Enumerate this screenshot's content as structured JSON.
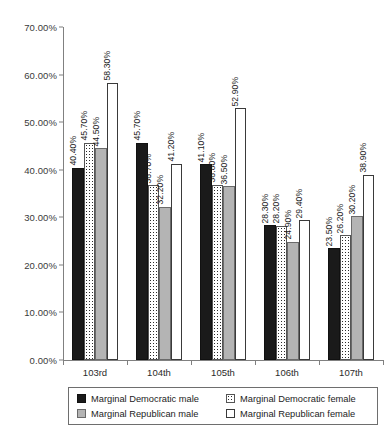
{
  "chart_data": {
    "type": "bar",
    "title": "",
    "subtitle": "",
    "xlabel": "",
    "ylabel": "",
    "categories": [
      "103rd",
      "104th",
      "105th",
      "106th",
      "107th"
    ],
    "series": [
      {
        "name": "Marginal Democratic male",
        "color": "#1a1a1a",
        "pattern": "solid-black",
        "values": [
          40.4,
          45.7,
          41.1,
          28.3,
          23.5
        ],
        "labels": [
          "40.40%",
          "45.70%",
          "41.10%",
          "28.30%",
          "23.50%"
        ]
      },
      {
        "name": "Marginal Democratic female",
        "color": "#ffffff",
        "pattern": "dotted",
        "values": [
          45.7,
          36.7,
          36.8,
          28.2,
          26.2
        ],
        "labels": [
          "45.70%",
          "36.70%",
          "36.80%",
          "28.20%",
          "26.20%"
        ]
      },
      {
        "name": "Marginal Republican male",
        "color": "#b4b4b4",
        "pattern": "solid-gray",
        "values": [
          44.5,
          32.2,
          36.5,
          24.9,
          30.2
        ],
        "labels": [
          "44.50%",
          "32.20%",
          "36.50%",
          "24.90%",
          "30.20%"
        ]
      },
      {
        "name": "Marginal Republican female",
        "color": "#ffffff",
        "pattern": "solid-white",
        "values": [
          58.3,
          41.2,
          52.9,
          29.4,
          38.9
        ],
        "labels": [
          "58.30%",
          "41.20%",
          "52.90%",
          "29.40%",
          "38.90%"
        ]
      }
    ],
    "ylim": [
      0,
      70
    ],
    "ytick_step": 10,
    "ytick_labels": [
      "0.00%",
      "10.00%",
      "20.00%",
      "30.00%",
      "40.00%",
      "50.00%",
      "60.00%",
      "70.00%"
    ],
    "ytick_values": [
      0,
      10,
      20,
      30,
      40,
      50,
      60,
      70
    ],
    "grid": false,
    "legend_position": "bottom",
    "value_labels_rotated": true
  },
  "legend": {
    "items": [
      {
        "label": "Marginal Democratic male",
        "swatch": "solid-black"
      },
      {
        "label": "Marginal Democratic female",
        "swatch": "dotted"
      },
      {
        "label": "Marginal Republican male",
        "swatch": "solid-gray"
      },
      {
        "label": "Marginal Republican female",
        "swatch": "solid-white"
      }
    ]
  }
}
